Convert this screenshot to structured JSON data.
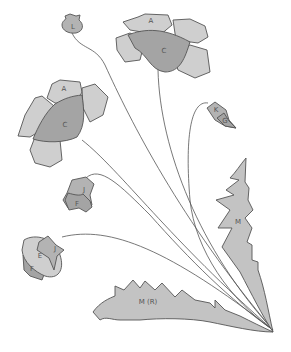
{
  "diagram": {
    "colors": {
      "light_piece": "#cfcfcf",
      "dark_piece": "#a4a4a4",
      "leaf": "#c3c3c3",
      "outline": "#555555"
    },
    "labels": {
      "top_flower_petal": "A",
      "top_flower_center": "C",
      "left_flower_petal": "A",
      "left_flower_center": "C",
      "top_bud": "L",
      "right_bud_top": "K",
      "right_bud_bottom": "G",
      "mid_bud_top": "J",
      "mid_bud_bottom": "F",
      "low_bud_petal": "E",
      "low_bud_top": "J",
      "low_bud_bottom": "F",
      "right_leaf": "M",
      "bottom_leaf": "M (R)"
    }
  }
}
